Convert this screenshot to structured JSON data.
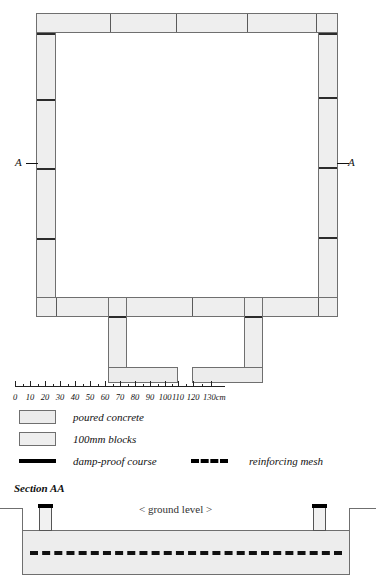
{
  "drawing": {
    "title": "foundation-plan",
    "section_label_left": "A",
    "section_label_right": "A",
    "section_title": "Section AA",
    "ground_level_text": "< ground level >"
  },
  "scale": {
    "unit_suffix": "cm",
    "ticks": [
      {
        "value": "0",
        "x": 0
      },
      {
        "value": "10",
        "x": 15
      },
      {
        "value": "20",
        "x": 30
      },
      {
        "value": "30",
        "x": 45
      },
      {
        "value": "40",
        "x": 60
      },
      {
        "value": "50",
        "x": 75
      },
      {
        "value": "60",
        "x": 90
      },
      {
        "value": "70",
        "x": 105
      },
      {
        "value": "80",
        "x": 120
      },
      {
        "value": "90",
        "x": 135
      },
      {
        "value": "100",
        "x": 150
      },
      {
        "value": "110",
        "x": 163
      },
      {
        "value": "120",
        "x": 178
      },
      {
        "value": "130cm",
        "x": 196
      }
    ]
  },
  "legend": {
    "items": [
      {
        "key": "poured-concrete",
        "label": "poured concrete",
        "swatch": "fill-concrete"
      },
      {
        "key": "100mm-blocks",
        "label": "100mm blocks",
        "swatch": "fill-block"
      },
      {
        "key": "damp-proof-course",
        "label": "damp-proof course",
        "swatch": "solid-bar"
      },
      {
        "key": "reinforcing-mesh",
        "label": "reinforcing mesh",
        "swatch": "dashed-bar"
      }
    ]
  },
  "colors": {
    "concrete_fill": "#ececec",
    "block_fill": "#eeeeee",
    "outline": "#6f6f6f",
    "dpc_black": "#000000",
    "ground_line": "#6f6f6f"
  }
}
